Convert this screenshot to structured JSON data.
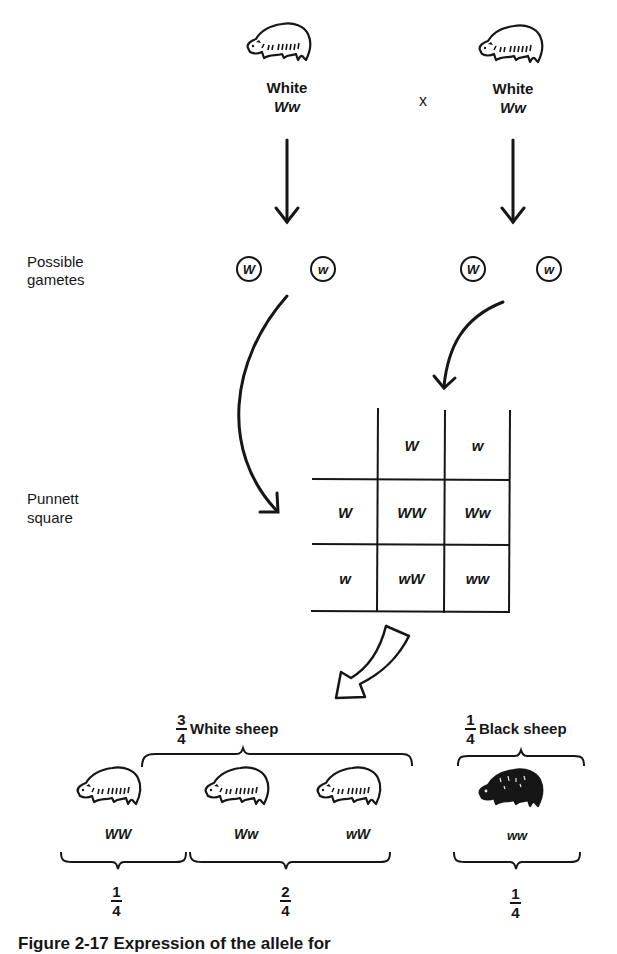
{
  "parents": {
    "left": {
      "phenotype": "White",
      "genotype": "Ww"
    },
    "cross_symbol": "x",
    "right": {
      "phenotype": "White",
      "genotype": "Ww"
    }
  },
  "labels": {
    "gametes": [
      "Possible",
      "gametes"
    ],
    "punnett": [
      "Punnett",
      "square"
    ]
  },
  "gametes": {
    "left": [
      "W",
      "w"
    ],
    "right": [
      "W",
      "w"
    ]
  },
  "punnett_square": {
    "column_headers": [
      "W",
      "w"
    ],
    "row_headers": [
      "W",
      "w"
    ],
    "cells": [
      [
        "WW",
        "Ww"
      ],
      [
        "wW",
        "ww"
      ]
    ]
  },
  "offspring": {
    "white_group": {
      "fraction_num": "3",
      "fraction_den": "4",
      "label": "White sheep"
    },
    "black_group": {
      "fraction_num": "1",
      "fraction_den": "4",
      "label": "Black sheep"
    },
    "sheep": [
      {
        "genotype": "WW",
        "color": "white"
      },
      {
        "genotype": "Ww",
        "color": "white"
      },
      {
        "genotype": "wW",
        "color": "white"
      },
      {
        "genotype": "ww",
        "color": "black"
      }
    ],
    "ratios": [
      {
        "num": "1",
        "den": "4"
      },
      {
        "num": "2",
        "den": "4"
      },
      {
        "num": "1",
        "den": "4"
      }
    ]
  },
  "caption": "Figure 2-17  Expression of the allele for"
}
